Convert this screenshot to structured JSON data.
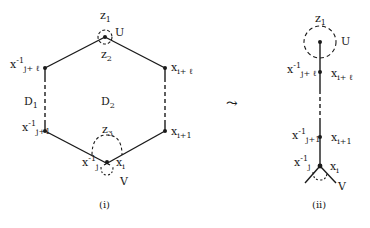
{
  "diagram": {
    "colors": {
      "ink": "#1a1a1a",
      "background": "#ffffff"
    },
    "panel_i": {
      "caption": "(i)",
      "regions": {
        "d1": "D",
        "d1_sub": "1",
        "d2": "D",
        "d2_sub": "2"
      },
      "top": {
        "z1": "z",
        "z1_sub": "1",
        "z2": "z",
        "z2_sub": "2",
        "u": "U"
      },
      "bottom": {
        "z3": "z",
        "z3_sub": "3",
        "v": "V"
      },
      "nodes": {
        "upper_left": {
          "base": "x",
          "sup": "-1",
          "sub": "j+ ℓ"
        },
        "upper_right": {
          "base": "x",
          "sub": "i+ ℓ"
        },
        "lower_left": {
          "base": "x",
          "sup": "-1",
          "sub": "j+1"
        },
        "lower_right": {
          "base": "x",
          "sub": "i+1"
        },
        "bottom_left": {
          "base": "x",
          "sup": "-1",
          "sub": "j"
        },
        "bottom_right": {
          "base": "x",
          "sub": "i"
        }
      }
    },
    "arrow": "⤳",
    "panel_ii": {
      "caption": "(ii)",
      "top": {
        "z1": "z",
        "z1_sub": "1",
        "u": "U"
      },
      "bottom": {
        "v": "V"
      },
      "nodes": {
        "upper_left": {
          "base": "x",
          "sup": "-1",
          "sub": "j+ ℓ"
        },
        "upper_right": {
          "base": "x",
          "sub": "i+ ℓ"
        },
        "lower_left": {
          "base": "x",
          "sup": "-1",
          "sub": "j+1"
        },
        "lower_right": {
          "base": "x",
          "sub": "i+1"
        },
        "bottom_left": {
          "base": "x",
          "sup": "-1",
          "sub": "j"
        },
        "bottom_right": {
          "base": "x",
          "sub": "i"
        }
      }
    }
  }
}
